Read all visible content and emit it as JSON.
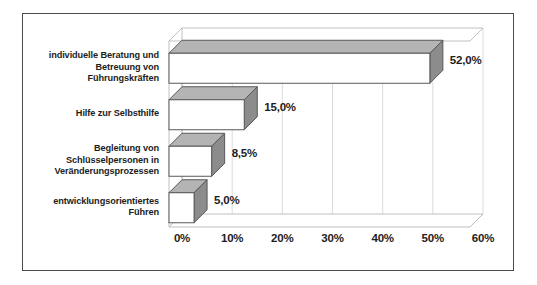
{
  "chart_data": {
    "type": "bar",
    "orientation": "horizontal",
    "style": "3d",
    "title": "",
    "subtitle": "",
    "xlabel": "",
    "ylabel": "",
    "categories": [
      "individuelle Beratung und\nBetreuung von\nFührungskräften",
      "Hilfe zur Selbsthilfe",
      "Begleitung von\nSchlüsselpersonen in\nVeränderungsprozessen",
      "entwicklungsorientiertes\nFühren"
    ],
    "values": [
      52.0,
      15.0,
      8.5,
      5.0
    ],
    "data_labels": [
      "52,0%",
      "15,0%",
      "8,5%",
      "5,0%"
    ],
    "xlim": [
      0,
      60
    ],
    "xticks": [
      0,
      10,
      20,
      30,
      40,
      50,
      60
    ],
    "xtick_labels": [
      "0%",
      "10%",
      "20%",
      "30%",
      "40%",
      "50%",
      "60%"
    ],
    "grid": true,
    "legend": false,
    "colors": {
      "bar_front": "#ffffff",
      "bar_top": "#b4b4b4",
      "bar_side": "#8c8c8c",
      "bar_outline": "#58585a",
      "gridline": "#d2d2d2",
      "axis": "#b0b0b0",
      "text": "#1d1d1d",
      "frame_border": "#4a4a4a",
      "background": "#ffffff"
    }
  }
}
